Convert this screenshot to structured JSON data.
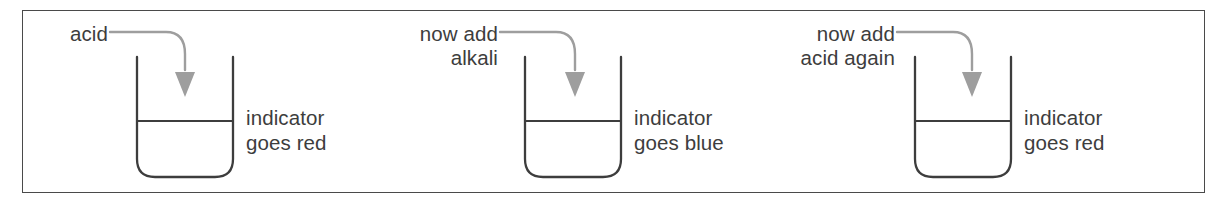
{
  "figure": {
    "type": "diagram",
    "border_color": "#4a4a4a",
    "background": "#ffffff",
    "text_color": "#3d3d3d",
    "arrow_color": "#9a9a9a",
    "beaker_color": "#3d3d3d",
    "stages": [
      {
        "id": "stage-1",
        "input_label": "acid",
        "result_label": "indicator\ngoes red",
        "result_color_word": "red"
      },
      {
        "id": "stage-2",
        "input_label": "now add\nalkali",
        "result_label": "indicator\ngoes blue",
        "result_color_word": "blue"
      },
      {
        "id": "stage-3",
        "input_label": "now add\nacid again",
        "result_label": "indicator\ngoes red",
        "result_color_word": "red"
      }
    ]
  }
}
